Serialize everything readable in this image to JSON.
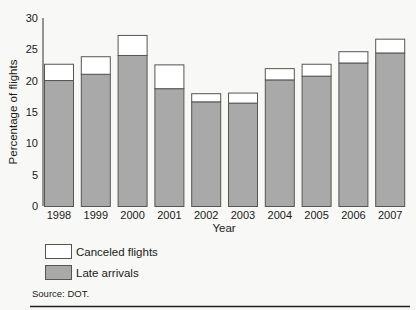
{
  "chart_data": {
    "type": "bar",
    "stacked": true,
    "title": "",
    "xlabel": "Year",
    "ylabel": "Percentage of flights",
    "ylim": [
      0,
      30
    ],
    "yticks": [
      0,
      5,
      10,
      15,
      20,
      25,
      30
    ],
    "categories": [
      "1998",
      "1999",
      "2000",
      "2001",
      "2002",
      "2003",
      "2004",
      "2005",
      "2006",
      "2007"
    ],
    "series": [
      {
        "name": "Late arrivals",
        "color": "#a9a9a9",
        "values": [
          20.1,
          21.1,
          24.1,
          18.8,
          16.7,
          16.5,
          20.2,
          20.8,
          22.9,
          24.5
        ]
      },
      {
        "name": "Canceled flights",
        "color": "#ffffff",
        "values": [
          2.6,
          2.8,
          3.2,
          3.8,
          1.3,
          1.6,
          1.8,
          1.9,
          1.8,
          2.2
        ]
      }
    ],
    "totals": [
      22.7,
      23.9,
      27.3,
      22.6,
      18.0,
      18.1,
      22.0,
      22.7,
      24.7,
      26.7
    ],
    "legend": {
      "placement": "bottom-left",
      "entries": [
        {
          "label": "Canceled flights",
          "color": "#ffffff"
        },
        {
          "label": "Late arrivals",
          "color": "#a9a9a9"
        }
      ]
    },
    "grid": false,
    "source": "Source: DOT."
  }
}
